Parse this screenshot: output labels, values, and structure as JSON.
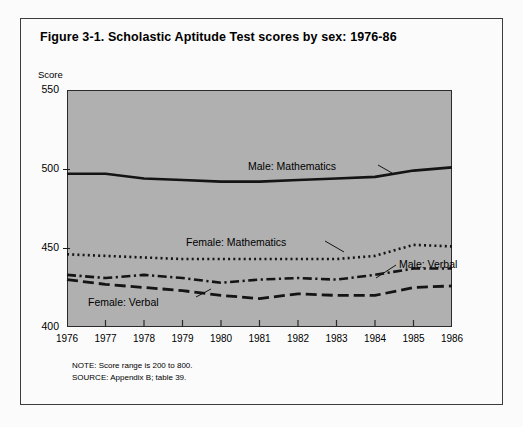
{
  "figure": {
    "title": "Figure 3-1.  Scholastic Aptitude Test scores by sex: 1976-86",
    "y_axis_unit_label": "Score",
    "note": "NOTE:  Score range is 200 to 800.",
    "source": "SOURCE:  Appendix B; table 39."
  },
  "colors": {
    "page_background": "#fbfbfb",
    "frame_border": "#3c3c3c",
    "plot_background": "#b0b0b0",
    "plot_border": "#2b2b2b",
    "line_color": "#141414",
    "text": "#000000"
  },
  "callouts": {
    "male_mathematics": "Male: Mathematics",
    "female_mathematics": "Female: Mathematics",
    "male_verbal": "Male: Verbal",
    "female_verbal": "Female: Verbal"
  },
  "chart_data": {
    "type": "line",
    "title": "Figure 3-1.  Scholastic Aptitude Test scores by sex: 1976-86",
    "xlabel": "",
    "ylabel": "Score",
    "xlim": [
      1976,
      1986
    ],
    "ylim": [
      400,
      550
    ],
    "yticks": [
      400,
      450,
      500,
      550
    ],
    "ytick_labels": [
      "400",
      "450",
      "500",
      "550"
    ],
    "x": [
      1976,
      1977,
      1978,
      1979,
      1980,
      1981,
      1982,
      1983,
      1984,
      1985,
      1986
    ],
    "xtick_labels": [
      "1976",
      "1977",
      "1978",
      "1979",
      "1980",
      "1981",
      "1982",
      "1983",
      "1984",
      "1985",
      "1986"
    ],
    "grid": false,
    "legend": "inline-callouts",
    "series": [
      {
        "name": "Male: Mathematics",
        "style": "solid",
        "values": [
          497,
          497,
          494,
          493,
          492,
          492,
          493,
          494,
          495,
          499,
          501
        ]
      },
      {
        "name": "Female: Mathematics",
        "style": "dotted",
        "values": [
          446,
          445,
          444,
          443,
          443,
          443,
          443,
          443,
          445,
          452,
          451
        ]
      },
      {
        "name": "Male: Verbal",
        "style": "dash-dot",
        "values": [
          433,
          431,
          433,
          431,
          428,
          430,
          431,
          430,
          433,
          437,
          437
        ]
      },
      {
        "name": "Female: Verbal",
        "style": "dashed",
        "values": [
          430,
          427,
          425,
          423,
          420,
          418,
          421,
          420,
          420,
          425,
          426
        ]
      }
    ]
  }
}
